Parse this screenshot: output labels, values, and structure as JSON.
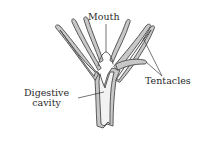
{
  "diagram": {
    "labels": {
      "mouth": "Mouth",
      "tentacles": "Tentacles",
      "digestive_line1": "Digestive",
      "digestive_line2": "cavity"
    },
    "colors": {
      "outline": "#4a4a4a",
      "wall_fill": "#c8c8c8",
      "inner_fill": "#f2f2f2",
      "text": "#2a2a2a",
      "background": "#ffffff"
    }
  }
}
